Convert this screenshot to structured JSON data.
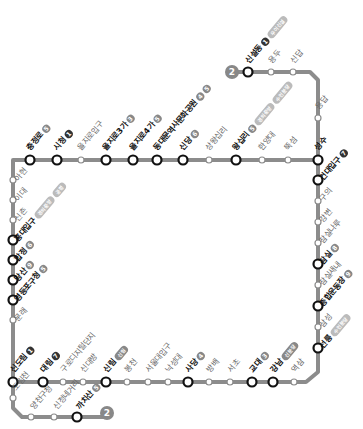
{
  "map": {
    "line_number": "2",
    "line_color": "#8c8c8c",
    "transfer_node_color": "#111111",
    "terminus_markers": [
      {
        "label": "2",
        "x": 232,
        "y": 72
      },
      {
        "label": "2",
        "x": 107,
        "y": 413
      }
    ]
  },
  "stations": {
    "top": [
      {
        "name": "충정로",
        "major": true,
        "transfer": [
          "5"
        ]
      },
      {
        "name": "시청",
        "major": true,
        "transfer": [
          "1"
        ]
      },
      {
        "name": "을지로입구",
        "major": false,
        "transfer": []
      },
      {
        "name": "을지로3가",
        "major": true,
        "transfer": [
          "3"
        ]
      },
      {
        "name": "을지로4가",
        "major": true,
        "transfer": [
          "5"
        ]
      },
      {
        "name": "동대문역사문화공원",
        "major": true,
        "transfer": [
          "4",
          "5"
        ]
      },
      {
        "name": "신당",
        "major": true,
        "transfer": [
          "6"
        ]
      },
      {
        "name": "상왕십리",
        "major": false,
        "transfer": []
      },
      {
        "name": "왕십리",
        "major": true,
        "transfer": [
          "5",
          "경의중앙",
          "수인분당"
        ]
      },
      {
        "name": "한양대",
        "major": false,
        "transfer": []
      },
      {
        "name": "뚝섬",
        "major": false,
        "transfer": []
      },
      {
        "name": "성수",
        "major": true,
        "transfer": []
      }
    ],
    "branch_seongsu": [
      {
        "name": "신설동",
        "major": true,
        "transfer": [
          "1",
          "우이신설"
        ]
      },
      {
        "name": "용두",
        "major": false,
        "transfer": []
      },
      {
        "name": "신답",
        "major": false,
        "transfer": []
      },
      {
        "name": "용답",
        "major": false,
        "transfer": []
      }
    ],
    "right": [
      {
        "name": "건대입구",
        "major": true,
        "transfer": [
          "7"
        ]
      },
      {
        "name": "구의",
        "major": false,
        "transfer": []
      },
      {
        "name": "강변",
        "major": false,
        "transfer": []
      },
      {
        "name": "잠실나루",
        "major": false,
        "transfer": []
      },
      {
        "name": "잠실",
        "major": true,
        "transfer": [
          "8"
        ]
      },
      {
        "name": "잠실새내",
        "major": false,
        "transfer": []
      },
      {
        "name": "종합운동장",
        "major": true,
        "transfer": [
          "9"
        ]
      },
      {
        "name": "삼성",
        "major": false,
        "transfer": []
      },
      {
        "name": "선릉",
        "major": true,
        "transfer": [
          "수인분당"
        ]
      }
    ],
    "bottom": [
      {
        "name": "신도림",
        "major": true,
        "transfer": [
          "1"
        ]
      },
      {
        "name": "대림",
        "major": true,
        "transfer": [
          "7"
        ]
      },
      {
        "name": "구로디지털단지",
        "major": false,
        "transfer": []
      },
      {
        "name": "신대방",
        "major": false,
        "transfer": []
      },
      {
        "name": "신림",
        "major": true,
        "transfer": [
          "신림"
        ]
      },
      {
        "name": "봉천",
        "major": false,
        "transfer": []
      },
      {
        "name": "서울대입구",
        "major": false,
        "transfer": []
      },
      {
        "name": "낙성대",
        "major": false,
        "transfer": []
      },
      {
        "name": "사당",
        "major": true,
        "transfer": [
          "4"
        ]
      },
      {
        "name": "방배",
        "major": false,
        "transfer": []
      },
      {
        "name": "서초",
        "major": false,
        "transfer": []
      },
      {
        "name": "교대",
        "major": true,
        "transfer": [
          "3"
        ]
      },
      {
        "name": "강남",
        "major": true,
        "transfer": [
          "신분당"
        ]
      },
      {
        "name": "역삼",
        "major": false,
        "transfer": []
      }
    ],
    "left": [
      {
        "name": "아현",
        "major": false,
        "transfer": []
      },
      {
        "name": "이대",
        "major": false,
        "transfer": []
      },
      {
        "name": "신촌",
        "major": false,
        "transfer": []
      },
      {
        "name": "홍대입구",
        "major": true,
        "transfer": [
          "경의중앙",
          "공항"
        ]
      },
      {
        "name": "합정",
        "major": true,
        "transfer": [
          "6"
        ]
      },
      {
        "name": "당산",
        "major": true,
        "transfer": [
          "9"
        ]
      },
      {
        "name": "영등포구청",
        "major": true,
        "transfer": [
          "5"
        ]
      },
      {
        "name": "문래",
        "major": false,
        "transfer": []
      }
    ],
    "branch_kkachisan": [
      {
        "name": "도림천",
        "major": false,
        "transfer": []
      },
      {
        "name": "양천구청",
        "major": false,
        "transfer": []
      },
      {
        "name": "신정네거리",
        "major": false,
        "transfer": []
      },
      {
        "name": "까치산",
        "major": true,
        "transfer": [
          "5"
        ]
      }
    ]
  }
}
